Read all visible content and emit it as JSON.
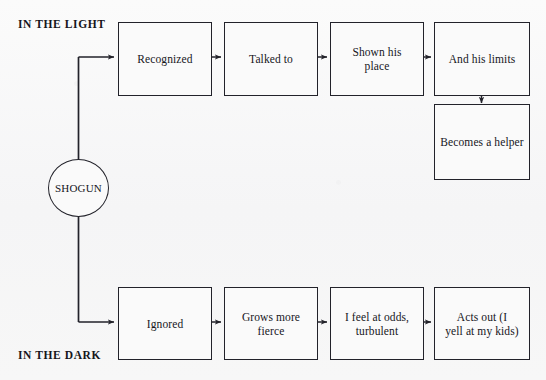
{
  "diagram": {
    "type": "flowchart",
    "title_visible": false,
    "background_color": "#f7f7f7",
    "line_color": "#22222a",
    "text_color": "#16161c",
    "bands": [
      {
        "id": "light",
        "label": "IN THE LIGHT"
      },
      {
        "id": "dark",
        "label": "IN THE DARK"
      }
    ],
    "hub": {
      "label": "SHOGUN"
    },
    "light_path": [
      {
        "id": "recognized",
        "label": "Recognized"
      },
      {
        "id": "talked-to",
        "label": "Talked to"
      },
      {
        "id": "shown-his-place",
        "label": "Shown his\nplace"
      },
      {
        "id": "and-his-limits",
        "label": "And his limits"
      },
      {
        "id": "becomes-a-helper",
        "label": "Becomes a helper"
      }
    ],
    "dark_path": [
      {
        "id": "ignored",
        "label": "Ignored"
      },
      {
        "id": "grows-more-fierce",
        "label": "Grows more\nfierce"
      },
      {
        "id": "i-feel-at-odds",
        "label": "I feel at odds,\nturbulent"
      },
      {
        "id": "acts-out",
        "label": "Acts out (I\nyell at my kids)"
      }
    ]
  }
}
